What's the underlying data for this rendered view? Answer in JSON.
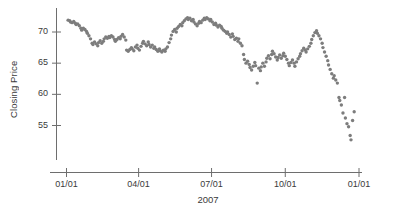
{
  "chart_data": {
    "type": "scatter",
    "title": "",
    "subtitle": "",
    "xlabel": "2007",
    "ylabel": "Closing Price",
    "legend": [],
    "legend_position": "none",
    "grid": false,
    "marker": {
      "shape": "circle",
      "color": "#7d7d7d",
      "size_px": 3.4
    },
    "axis_color": "#6e6e6e",
    "x_type": "date",
    "x_tick_labels": [
      "01/01",
      "04/01",
      "07/01",
      "10/01",
      "01/01"
    ],
    "x_tick_values": [
      0,
      90,
      181,
      273,
      365
    ],
    "xlim": [
      -6,
      372
    ],
    "ylim": [
      51.5,
      73.2
    ],
    "y_tick_labels": [
      "55",
      "60",
      "65",
      "70"
    ],
    "y_tick_values": [
      55,
      60,
      65,
      70
    ],
    "x": [
      2,
      4,
      5,
      7,
      9,
      11,
      12,
      14,
      16,
      18,
      19,
      21,
      23,
      25,
      26,
      28,
      30,
      32,
      33,
      35,
      37,
      39,
      40,
      42,
      44,
      46,
      47,
      49,
      51,
      53,
      54,
      56,
      58,
      60,
      61,
      63,
      65,
      67,
      68,
      70,
      72,
      74,
      75,
      77,
      79,
      81,
      82,
      84,
      86,
      88,
      89,
      91,
      93,
      95,
      96,
      98,
      100,
      102,
      103,
      105,
      107,
      109,
      110,
      112,
      114,
      116,
      117,
      119,
      121,
      123,
      124,
      126,
      128,
      130,
      131,
      133,
      135,
      137,
      138,
      140,
      142,
      144,
      145,
      147,
      149,
      151,
      152,
      154,
      156,
      158,
      159,
      161,
      163,
      165,
      166,
      168,
      170,
      172,
      173,
      175,
      177,
      179,
      180,
      182,
      184,
      186,
      187,
      189,
      191,
      193,
      194,
      196,
      198,
      200,
      201,
      203,
      205,
      207,
      208,
      210,
      212,
      214,
      215,
      217,
      219,
      221,
      222,
      224,
      226,
      228,
      229,
      231,
      233,
      235,
      236,
      238,
      240,
      242,
      243,
      245,
      247,
      249,
      250,
      252,
      254,
      256,
      257,
      259,
      261,
      263,
      264,
      266,
      268,
      270,
      271,
      273,
      275,
      277,
      278,
      280,
      282,
      284,
      285,
      287,
      289,
      291,
      292,
      294,
      296,
      298,
      299,
      301,
      303,
      305,
      306,
      308,
      310,
      312,
      313,
      315,
      317,
      319,
      320,
      322,
      324,
      326,
      327,
      329,
      331,
      333,
      334,
      336,
      338,
      340,
      341,
      343,
      345,
      347,
      348,
      350,
      352,
      354,
      355,
      357,
      359
    ],
    "y": [
      71.9,
      71.8,
      71.6,
      71.5,
      71.7,
      71.4,
      71.2,
      71.3,
      71.0,
      70.6,
      70.3,
      70.6,
      70.4,
      70.1,
      69.8,
      69.4,
      68.9,
      68.2,
      68.0,
      68.4,
      68.1,
      67.8,
      68.3,
      68.6,
      68.2,
      68.5,
      68.9,
      69.2,
      69.0,
      69.3,
      69.1,
      69.4,
      69.2,
      68.8,
      68.5,
      68.8,
      69.1,
      68.9,
      69.3,
      69.6,
      69.2,
      68.7,
      67.1,
      66.9,
      67.2,
      67.5,
      67.3,
      67.0,
      67.6,
      67.9,
      67.4,
      67.1,
      67.7,
      68.2,
      68.5,
      68.1,
      67.8,
      68.4,
      68.0,
      67.6,
      67.9,
      67.4,
      67.6,
      67.2,
      66.9,
      67.3,
      67.0,
      66.8,
      67.1,
      66.9,
      67.3,
      67.6,
      68.3,
      68.9,
      69.5,
      70.1,
      70.4,
      70.0,
      70.6,
      70.9,
      71.2,
      71.0,
      71.5,
      71.8,
      72.1,
      72.3,
      72.0,
      72.2,
      71.8,
      72.0,
      71.6,
      71.3,
      71.0,
      71.4,
      71.7,
      71.5,
      71.9,
      72.2,
      72.0,
      72.3,
      72.1,
      71.8,
      72.0,
      71.6,
      71.2,
      71.4,
      71.1,
      70.8,
      71.1,
      70.9,
      70.6,
      70.3,
      70.1,
      69.8,
      70.0,
      69.6,
      69.2,
      69.7,
      69.3,
      68.8,
      69.0,
      68.5,
      68.9,
      68.2,
      67.8,
      66.4,
      65.6,
      65.0,
      65.3,
      64.8,
      64.3,
      63.9,
      64.5,
      65.1,
      64.6,
      61.8,
      64.2,
      63.8,
      64.4,
      65.0,
      64.5,
      65.2,
      65.8,
      66.2,
      65.7,
      66.4,
      66.9,
      66.5,
      66.0,
      65.5,
      65.9,
      66.3,
      65.8,
      66.2,
      66.6,
      66.1,
      65.6,
      65.0,
      64.6,
      65.1,
      65.5,
      65.0,
      64.5,
      65.2,
      65.7,
      66.1,
      66.5,
      67.0,
      67.4,
      67.1,
      66.8,
      67.3,
      67.7,
      68.2,
      68.8,
      69.4,
      69.9,
      70.2,
      69.8,
      69.4,
      68.9,
      68.2,
      67.5,
      66.8,
      66.1,
      65.4,
      64.7,
      64.0,
      63.3,
      62.6,
      63.0,
      62.3,
      61.8,
      59.5,
      59.0,
      58.3,
      57.0,
      59.5,
      56.2,
      55.3,
      54.8,
      53.4,
      52.7,
      55.8,
      57.2,
      57.8,
      57.0,
      58.4,
      56.8,
      56.1,
      57.5,
      61.5,
      58.0,
      59.2,
      57.3,
      56.4,
      55.3,
      58.6,
      59.8,
      58.2,
      57.0,
      58.5,
      58.8
    ]
  }
}
